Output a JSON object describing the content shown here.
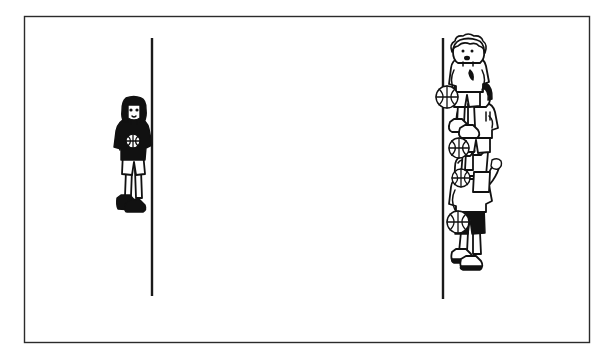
{
  "image": {
    "title": "Cartoon line drawing of children with basketballs",
    "style": "black-and-white pen-and-ink line art",
    "background_color": "#ffffff",
    "ink_color": "#111111",
    "width": 613,
    "height": 360
  },
  "frame": {
    "name": "panel-border",
    "x": 24,
    "y": 16,
    "width": 565,
    "height": 326,
    "stroke_color": "#2b2b2b"
  },
  "dividers": [
    {
      "name": "left-vertical-line",
      "x": 152,
      "y_top": 38,
      "y_bottom": 296,
      "stroke_color": "#1a1a1a"
    },
    {
      "name": "right-vertical-line",
      "x": 443,
      "y_top": 38,
      "y_bottom": 299,
      "stroke_color": "#1a1a1a"
    }
  ],
  "figures": {
    "left_group": {
      "label": "lone child",
      "count": 1,
      "members": [
        {
          "name": "child-alone",
          "hair": "dark bob",
          "hair_color": "#111111",
          "shirt": "dark long-sleeve top",
          "shirt_color": "#111111",
          "shorts": "light shorts",
          "shorts_color": "#ffffff",
          "shoes": "dark sneakers",
          "shoes_color": "#111111",
          "holding_ball": true,
          "x": 133,
          "y": 155
        }
      ]
    },
    "right_group": {
      "label": "cluster of children",
      "count": 4,
      "members": [
        {
          "name": "child-top",
          "hair": "light curly hair",
          "hair_color": "#ffffff",
          "shirt": "light t-shirt",
          "shirt_color": "#ffffff",
          "shorts": "light shorts",
          "shorts_color": "#ffffff",
          "shoes": "light sneakers",
          "shoes_color": "#ffffff",
          "holding_ball": true,
          "x": 468,
          "y": 70
        },
        {
          "name": "child-second",
          "hair": "dark bowl cut",
          "hair_color": "#111111",
          "shirt": "light t-shirt",
          "shirt_color": "#ffffff",
          "shorts": "light shorts",
          "shorts_color": "#ffffff",
          "shoes": "light sneakers",
          "shoes_color": "#ffffff",
          "holding_ball": true,
          "x": 477,
          "y": 125
        },
        {
          "name": "child-third",
          "hair": "light hair",
          "hair_color": "#ffffff",
          "shirt": "light t-shirt",
          "shirt_color": "#ffffff",
          "shorts": "light shorts",
          "shorts_color": "#ffffff",
          "shoes": "light sneakers",
          "shoes_color": "#ffffff",
          "holding_ball": true,
          "x": 470,
          "y": 160
        },
        {
          "name": "child-bottom",
          "hair": "light wavy hair",
          "hair_color": "#ffffff",
          "shirt": "light t-shirt",
          "shirt_color": "#ffffff",
          "shorts": "dark shorts",
          "shorts_color": "#111111",
          "shoes": "light sneakers with dark soles",
          "shoes_color": "#ffffff",
          "holding_ball": true,
          "x": 470,
          "y": 215
        }
      ]
    }
  },
  "balls": [
    {
      "name": "basketball-left-child",
      "cx": 133,
      "cy": 141,
      "r": 7
    },
    {
      "name": "basketball-top-right",
      "cx": 447,
      "cy": 97,
      "r": 11
    },
    {
      "name": "basketball-second-right",
      "cx": 459,
      "cy": 148,
      "r": 10
    },
    {
      "name": "basketball-third-right",
      "cx": 461,
      "cy": 178,
      "r": 9
    },
    {
      "name": "basketball-bottom-right",
      "cx": 458,
      "cy": 222,
      "r": 11
    }
  ]
}
